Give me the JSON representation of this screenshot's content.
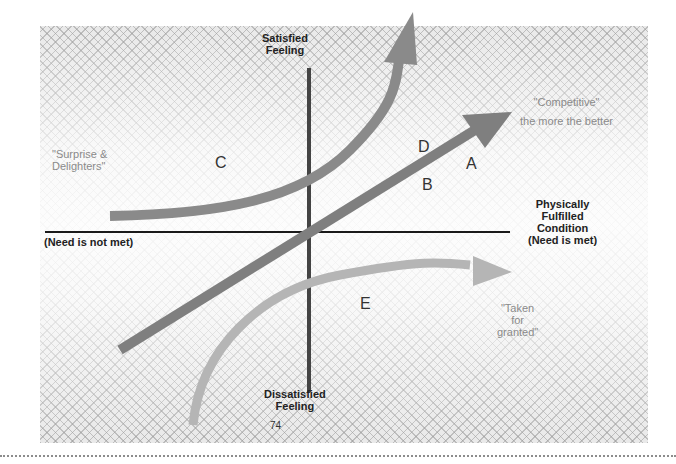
{
  "diagram": {
    "axes": {
      "y_top": [
        "Satisfied",
        "Feeling"
      ],
      "y_bottom": [
        "Dissatisfied",
        "Feeling"
      ],
      "x_right": [
        "Physically",
        "Fulfilled",
        "Condition",
        "(Need is met)"
      ],
      "x_left": "(Need is not met)"
    },
    "curves": {
      "C_label": "\"Surprise & Delighters\"",
      "C_lines": [
        "\"Surprise &",
        "Delighters\""
      ],
      "A_label": "\"Competitive\"",
      "A_sub": "the more the better",
      "E_lines": [
        "\"Taken",
        "for",
        "granted\""
      ]
    },
    "letters": {
      "A": "A",
      "B": "B",
      "C": "C",
      "D": "D",
      "E": "E"
    },
    "page_number": "74",
    "colors": {
      "arrow_dark": "#7a7a7a",
      "arrow_light": "#a9a9a9",
      "axis": "#1a1a1a",
      "background": "#e9e9e9"
    }
  }
}
